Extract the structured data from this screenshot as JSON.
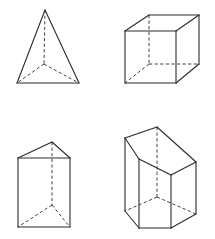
{
  "figure": {
    "stroke_color": "#2b2b2b",
    "background": "#ffffff",
    "shapes": [
      {
        "name": "tetrahedron",
        "position": "top-left",
        "visible_edges": [
          [
            [
              45,
              10
            ],
            [
              17,
              83
            ]
          ],
          [
            [
              45,
              10
            ],
            [
              79,
              83
            ]
          ],
          [
            [
              17,
              83
            ],
            [
              79,
              83
            ]
          ]
        ],
        "hidden_edges": [
          [
            [
              45,
              10
            ],
            [
              44,
              64
            ]
          ],
          [
            [
              44,
              64
            ],
            [
              17,
              83
            ]
          ],
          [
            [
              44,
              64
            ],
            [
              79,
              83
            ]
          ]
        ]
      },
      {
        "name": "cube",
        "position": "top-right",
        "visible_edges": [
          [
            [
              125,
              31
            ],
            [
              176,
              31
            ]
          ],
          [
            [
              176,
              31
            ],
            [
              176,
              83
            ]
          ],
          [
            [
              176,
              83
            ],
            [
              125,
              83
            ]
          ],
          [
            [
              125,
              83
            ],
            [
              125,
              31
            ]
          ],
          [
            [
              125,
              31
            ],
            [
              149,
              15
            ]
          ],
          [
            [
              176,
              31
            ],
            [
              199,
              15
            ]
          ],
          [
            [
              149,
              15
            ],
            [
              199,
              15
            ]
          ],
          [
            [
              199,
              15
            ],
            [
              199,
              64
            ]
          ],
          [
            [
              176,
              83
            ],
            [
              199,
              64
            ]
          ]
        ],
        "hidden_edges": [
          [
            [
              149,
              15
            ],
            [
              149,
              64
            ]
          ],
          [
            [
              149,
              64
            ],
            [
              199,
              64
            ]
          ],
          [
            [
              149,
              64
            ],
            [
              125,
              83
            ]
          ]
        ]
      },
      {
        "name": "triangular-prism",
        "position": "bottom-left",
        "visible_edges": [
          [
            [
              18,
              158
            ],
            [
              70,
              158
            ]
          ],
          [
            [
              18,
              158
            ],
            [
              52,
              142
            ]
          ],
          [
            [
              52,
              142
            ],
            [
              70,
              158
            ]
          ],
          [
            [
              18,
              158
            ],
            [
              18,
              227
            ]
          ],
          [
            [
              70,
              158
            ],
            [
              70,
              227
            ]
          ],
          [
            [
              18,
              227
            ],
            [
              70,
              227
            ]
          ]
        ],
        "hidden_edges": [
          [
            [
              52,
              142
            ],
            [
              52,
              205
            ]
          ],
          [
            [
              52,
              205
            ],
            [
              18,
              227
            ]
          ],
          [
            [
              52,
              205
            ],
            [
              70,
              227
            ]
          ]
        ]
      },
      {
        "name": "pentagonal-prism",
        "position": "bottom-right",
        "visible_edges": [
          [
            [
              125,
              138
            ],
            [
              157,
              127
            ]
          ],
          [
            [
              157,
              127
            ],
            [
              196,
              162
            ]
          ],
          [
            [
              196,
              162
            ],
            [
              171,
              175
            ]
          ],
          [
            [
              171,
              175
            ],
            [
              139,
              159
            ]
          ],
          [
            [
              139,
              159
            ],
            [
              125,
              138
            ]
          ],
          [
            [
              125,
              138
            ],
            [
              125,
              211
            ]
          ],
          [
            [
              139,
              159
            ],
            [
              139,
              228
            ]
          ],
          [
            [
              171,
              175
            ],
            [
              171,
              228
            ]
          ],
          [
            [
              196,
              162
            ],
            [
              196,
              214
            ]
          ],
          [
            [
              125,
              211
            ],
            [
              139,
              228
            ]
          ],
          [
            [
              139,
              228
            ],
            [
              171,
              228
            ]
          ],
          [
            [
              171,
              228
            ],
            [
              196,
              214
            ]
          ]
        ],
        "hidden_edges": [
          [
            [
              157,
              127
            ],
            [
              157,
              197
            ]
          ],
          [
            [
              157,
              197
            ],
            [
              125,
              211
            ]
          ],
          [
            [
              157,
              197
            ],
            [
              196,
              214
            ]
          ]
        ]
      }
    ]
  }
}
